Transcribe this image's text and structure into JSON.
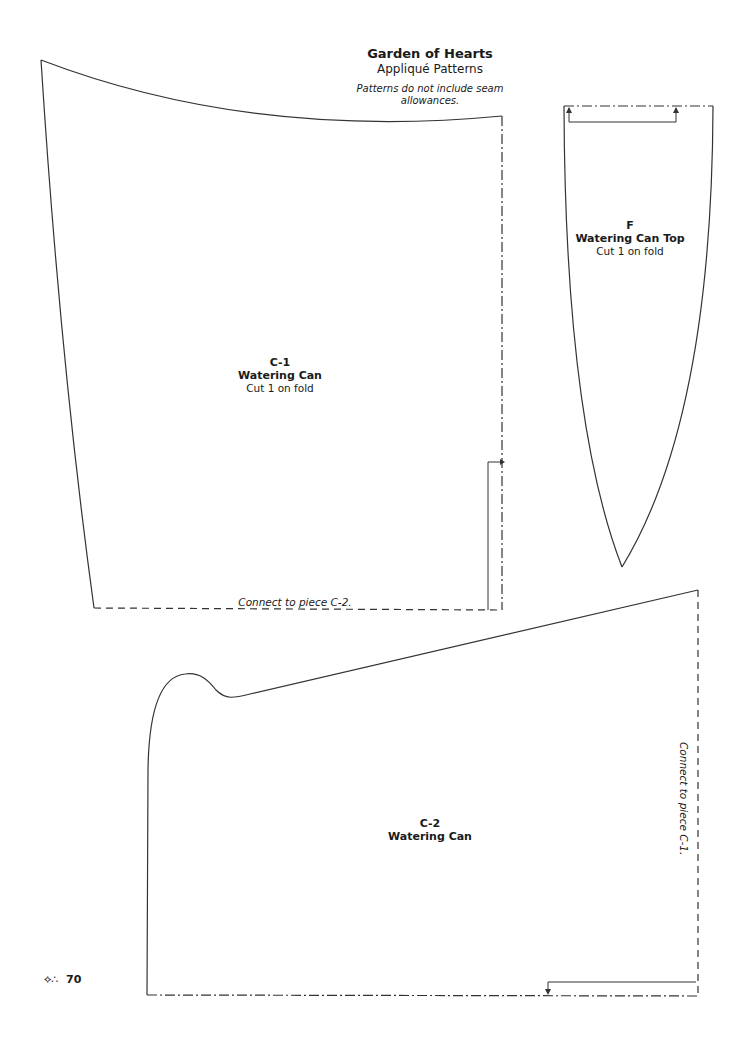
{
  "header": {
    "title": "Garden of Hearts",
    "subtitle": "Appliqué Patterns",
    "note": "Patterns do not include seam allowances."
  },
  "pieces": {
    "c1": {
      "code": "C-1",
      "name": "Watering Can",
      "instruction": "Cut 1 on fold"
    },
    "f": {
      "code": "F",
      "name": "Watering Can Top",
      "instruction": "Cut 1 on fold"
    },
    "c2": {
      "code": "C-2",
      "name": "Watering Can"
    }
  },
  "connectors": {
    "c1_bottom": "Connect to piece C-2.",
    "c2_right": "Connect to piece C-1."
  },
  "footer": {
    "ornament_icon": "vine-ornament-icon",
    "page_number": "70"
  },
  "colors": {
    "line": "#333333",
    "background": "#ffffff",
    "text": "#1a1a1a"
  }
}
